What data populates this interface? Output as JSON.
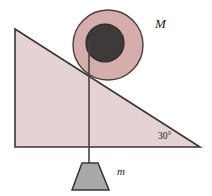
{
  "figure": {
    "kind": "physics-diagram",
    "background_color": "#ffffff",
    "width": 212,
    "height": 196
  },
  "colors": {
    "incline_fill": "#e5d2d2",
    "incline_stroke": "#3a3334",
    "pulley_ring_fill": "#d6adad",
    "pulley_ring_stroke": "#4a3f40",
    "pulley_hub_fill": "#3f3a3a",
    "pulley_hub_stroke": "#2b2727",
    "block_fill": "#a9a9a9",
    "block_stroke": "#3a3334",
    "rope_stroke": "#4a4244",
    "text_color": "#1a1a1a"
  },
  "incline": {
    "name": "inclined-plane",
    "apex": {
      "x": 15,
      "y": 29
    },
    "bottom_left": {
      "x": 15,
      "y": 147
    },
    "bottom_right": {
      "x": 200,
      "y": 147
    },
    "angle_label": "30°",
    "angle_label_position": {
      "x": 158,
      "y": 139
    }
  },
  "pulley": {
    "name": "pulley",
    "center": {
      "x": 108,
      "y": 45
    },
    "outer_radius": 35,
    "hub_center": {
      "x": 105,
      "y": 43
    },
    "hub_radius": 19,
    "label": "M",
    "label_position": {
      "x": 155,
      "y": 28
    }
  },
  "rope": {
    "name": "rope",
    "top": {
      "x": 89,
      "y": 40
    },
    "bottom": {
      "x": 89,
      "y": 163
    },
    "width": 1.6
  },
  "hanging_block": {
    "name": "hanging-mass",
    "shape": "trapezoid",
    "top_left": {
      "x": 82,
      "y": 163
    },
    "top_right": {
      "x": 98,
      "y": 163
    },
    "bottom_right": {
      "x": 109,
      "y": 190
    },
    "bottom_left": {
      "x": 72,
      "y": 190
    },
    "label": "m",
    "label_position": {
      "x": 117,
      "y": 175
    }
  }
}
